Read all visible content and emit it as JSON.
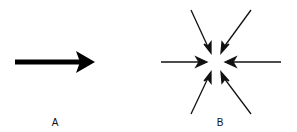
{
  "diagram": {
    "panels": [
      {
        "label": "A",
        "description": "single thick arrow pointing right",
        "arrows": [
          {
            "from": [
              15,
              62
            ],
            "to": [
              95,
              62
            ],
            "thickness": 5
          }
        ]
      },
      {
        "label": "B",
        "description": "six arrows converging on a central point",
        "center": [
          216,
          62
        ],
        "arrows": [
          {
            "from": [
              161,
              62
            ],
            "to": [
              207,
              62
            ]
          },
          {
            "from": [
              281,
              62
            ],
            "to": [
              225,
              62
            ]
          },
          {
            "from": [
              191,
              10
            ],
            "to": [
              211,
              53
            ]
          },
          {
            "from": [
              251,
              10
            ],
            "to": [
              221,
              53
            ]
          },
          {
            "from": [
              191,
              114
            ],
            "to": [
              211,
              72
            ]
          },
          {
            "from": [
              251,
              114
            ],
            "to": [
              221,
              72
            ]
          }
        ]
      }
    ]
  }
}
